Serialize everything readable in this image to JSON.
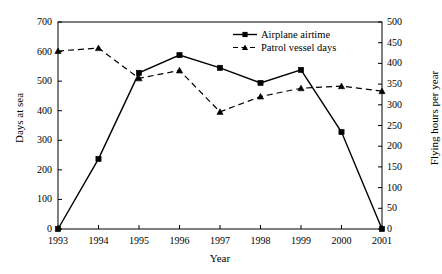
{
  "chart_data": {
    "type": "line",
    "title": "",
    "xlabel": "Year",
    "ylabel": "Days at sea",
    "y2label": "Flying hours per year",
    "categories": [
      "1993",
      "1994",
      "1995",
      "1996",
      "1997",
      "1998",
      "1999",
      "2000",
      "2001"
    ],
    "ylim": [
      0,
      700
    ],
    "y2lim": [
      0,
      500
    ],
    "yticks": [
      "0",
      "100",
      "200",
      "300",
      "400",
      "500",
      "600",
      "700"
    ],
    "ytick_values": [
      0,
      100,
      200,
      300,
      400,
      500,
      600,
      700
    ],
    "y2ticks": [
      "0",
      "50",
      "100",
      "150",
      "200",
      "250",
      "300",
      "350",
      "400",
      "450",
      "500"
    ],
    "y2tick_values": [
      0,
      50,
      100,
      150,
      200,
      250,
      300,
      350,
      400,
      450,
      500
    ],
    "grid": false,
    "legend_position": "top-right",
    "series": [
      {
        "name": "Airplane airtime",
        "axis": "left",
        "style": "solid",
        "marker": "square",
        "color": "#000000",
        "values": [
          0,
          237,
          528,
          588,
          545,
          494,
          538,
          328,
          0
        ]
      },
      {
        "name": "Patrol vessel days",
        "axis": "right",
        "style": "dashed",
        "marker": "triangle",
        "color": "#000000",
        "values": [
          430,
          437,
          364,
          383,
          283,
          320,
          340,
          345,
          333
        ]
      }
    ]
  },
  "legend": {
    "items": [
      {
        "label": "Airplane airtime"
      },
      {
        "label": "Patrol vessel days"
      }
    ]
  }
}
